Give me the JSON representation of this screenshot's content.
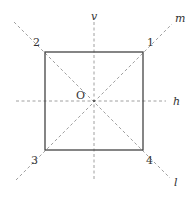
{
  "diagram": {
    "colors": {
      "square_stroke": "#444444",
      "axis_stroke": "#888888",
      "label": "#333333"
    },
    "center_label": "O",
    "vertices": [
      {
        "label": "1",
        "position": "top-right"
      },
      {
        "label": "2",
        "position": "top-left"
      },
      {
        "label": "3",
        "position": "bottom-left"
      },
      {
        "label": "4",
        "position": "bottom-right"
      }
    ],
    "axes": [
      {
        "label": "v",
        "orientation": "vertical"
      },
      {
        "label": "h",
        "orientation": "horizontal"
      },
      {
        "label": "m",
        "orientation": "diagonal through vertices 3 and 1"
      },
      {
        "label": "l",
        "orientation": "diagonal through vertices 2 and 4"
      }
    ]
  }
}
